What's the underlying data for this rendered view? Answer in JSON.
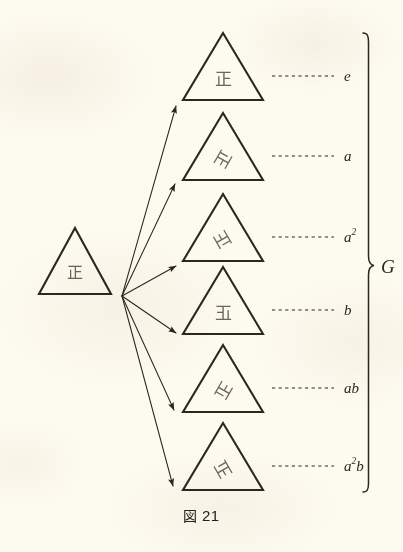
{
  "figure": {
    "caption_symbol": "図",
    "caption_number": "21",
    "background_color": "#fdfaf0",
    "ink_color": "#2b2721",
    "glyph_color": "#6b6659"
  },
  "source": {
    "name": "source-triangle",
    "glyph": "正",
    "rotation_deg": 0,
    "mirrored": false
  },
  "group_brace": {
    "label": "G",
    "label_name": "group-label-G"
  },
  "cosets": [
    {
      "id": "e",
      "label": "e",
      "label_sup": "",
      "label_tail": "",
      "glyph": "正",
      "rotation_deg": 0,
      "mirrored": false,
      "description": "identity element"
    },
    {
      "id": "a",
      "label": "a",
      "label_sup": "",
      "label_tail": "",
      "glyph": "正",
      "rotation_deg": 120,
      "mirrored": false,
      "description": "rotation by 120 degrees"
    },
    {
      "id": "a2",
      "label": "a",
      "label_sup": "2",
      "label_tail": "",
      "glyph": "正",
      "rotation_deg": 240,
      "mirrored": false,
      "description": "rotation by 240 degrees"
    },
    {
      "id": "b",
      "label": "b",
      "label_sup": "",
      "label_tail": "",
      "glyph": "正",
      "rotation_deg": 0,
      "mirrored": true,
      "description": "reflection"
    },
    {
      "id": "ab",
      "label": "ab",
      "label_sup": "",
      "label_tail": "",
      "glyph": "正",
      "rotation_deg": 120,
      "mirrored": true,
      "description": "reflection composed with rotation by 120 degrees"
    },
    {
      "id": "a2b",
      "label": "a",
      "label_sup": "2",
      "label_tail": "b",
      "glyph": "正",
      "rotation_deg": 240,
      "mirrored": true,
      "description": "reflection composed with rotation by 240 degrees"
    }
  ]
}
